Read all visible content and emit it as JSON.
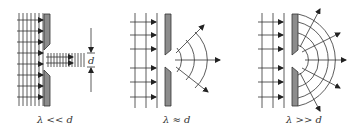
{
  "figure": {
    "type": "diffraction-through-slit",
    "colors": {
      "line": "#333333",
      "barrier": "#8c8c8c",
      "barrier_stroke": "#333333",
      "background": "#ffffff"
    },
    "panels": [
      {
        "id": "small-wavelength",
        "caption": "λ << d",
        "dimension_label": "d",
        "behavior": "straight-through beam"
      },
      {
        "id": "comparable-wavelength",
        "caption": "λ ≈ d",
        "behavior": "moderate spreading"
      },
      {
        "id": "large-wavelength",
        "caption": "λ >> d",
        "behavior": "wide semicircular spreading"
      }
    ]
  }
}
